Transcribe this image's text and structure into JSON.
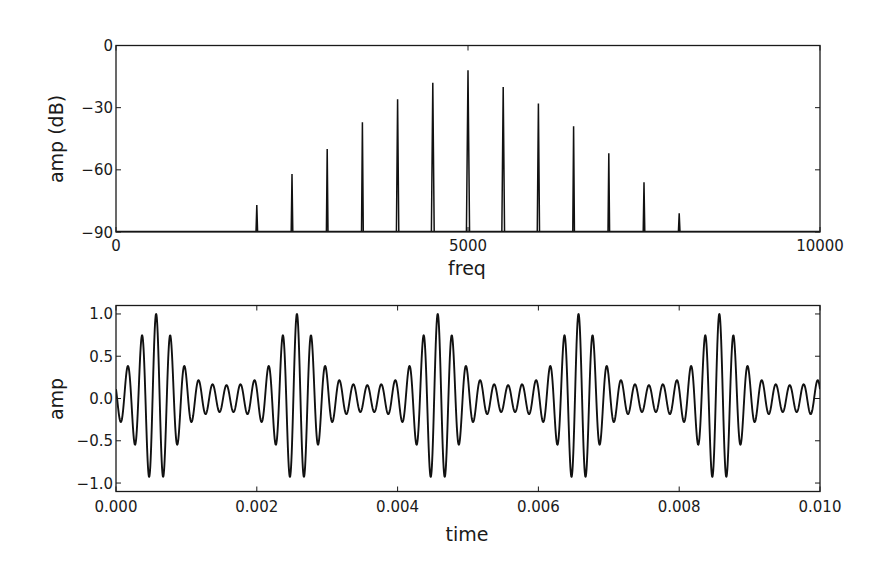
{
  "chart_data": [
    {
      "type": "bar",
      "subtype": "spectrum-stem",
      "title": "",
      "xlabel": "freq",
      "ylabel": "amp (dB)",
      "xlim": [
        0,
        10000
      ],
      "ylim": [
        -90,
        0
      ],
      "xticks": [
        0,
        5000,
        10000
      ],
      "xtick_labels": [
        "0",
        "5000",
        "10000"
      ],
      "yticks": [
        0,
        -30,
        -60,
        -90
      ],
      "ytick_labels": [
        "0",
        "−30",
        "−60",
        "−90"
      ],
      "grid": false,
      "legend": null,
      "x": [
        2000,
        2500,
        3000,
        3500,
        4000,
        4500,
        5000,
        5500,
        6000,
        6500,
        7000,
        7500,
        8000
      ],
      "values": [
        -77,
        -62,
        -50,
        -37,
        -26,
        -18,
        -12,
        -20,
        -28,
        -39,
        -52,
        -66,
        -81
      ],
      "color": "#111111"
    },
    {
      "type": "line",
      "title": "",
      "xlabel": "time",
      "ylabel": "amp",
      "xlim": [
        0.0,
        0.01
      ],
      "ylim": [
        -1.1,
        1.1
      ],
      "xticks": [
        0.0,
        0.002,
        0.004,
        0.006,
        0.008,
        0.01
      ],
      "xtick_labels": [
        "0.000",
        "0.002",
        "0.004",
        "0.006",
        "0.008",
        "0.010"
      ],
      "yticks": [
        1.0,
        0.5,
        0.0,
        -0.5,
        -1.0
      ],
      "ytick_labels": [
        "1.0",
        "0.5",
        "0.0",
        "−0.5",
        "−1.0"
      ],
      "grid": false,
      "legend": null,
      "description": "5000 Hz carrier with envelope repeating every 0.002 s (sum of 500 Hz harmonics from the spectrum above), normalized to peak 1.0",
      "carrier_hz": 5000,
      "envelope_period_s": 0.002,
      "envelope_peak_time_s": 0.00057,
      "start_value": -0.55,
      "peak_amplitudes_first_period": [
        0.65,
        0.82,
        1.0,
        0.87,
        0.77,
        0.73,
        0.73,
        0.68,
        0.58,
        0.55
      ],
      "color": "#111111"
    }
  ]
}
